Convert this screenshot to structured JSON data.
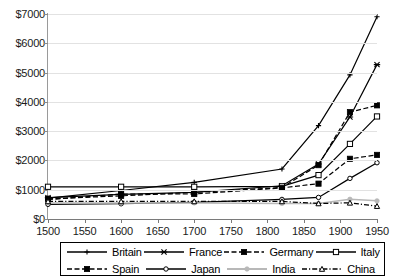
{
  "chart_data": {
    "type": "line",
    "title": "",
    "xlabel": "",
    "ylabel": "",
    "x": [
      1500,
      1600,
      1700,
      1820,
      1870,
      1913,
      1950
    ],
    "xticks": [
      1500,
      1550,
      1600,
      1650,
      1700,
      1750,
      1800,
      1850,
      1900,
      1950
    ],
    "xticklabels": [
      "1500",
      "1550",
      "1600",
      "1650",
      "1700",
      "1750",
      "1800",
      "1850",
      "1900",
      "1950"
    ],
    "yticks": [
      0,
      1000,
      2000,
      3000,
      4000,
      5000,
      6000,
      7000
    ],
    "yticklabels": [
      "$0",
      "$1000",
      "$2000",
      "$3000",
      "$4000",
      "$5000",
      "$6000",
      "$7000"
    ],
    "xlim": [
      1500,
      1950
    ],
    "ylim": [
      0,
      7000
    ],
    "grid": true,
    "legend_position": "bottom",
    "series": [
      {
        "name": "Britain",
        "color": "#000000",
        "dash": "none",
        "marker": "plus",
        "values": [
          714,
          974,
          1250,
          1707,
          3190,
          4921,
          6907
        ]
      },
      {
        "name": "France",
        "color": "#000000",
        "dash": "none",
        "marker": "star",
        "values": [
          727,
          841,
          910,
          1135,
          1876,
          3485,
          5271
        ]
      },
      {
        "name": "Germany",
        "color": "#000000",
        "dash": "dashed",
        "marker": "square-filled",
        "values": [
          688,
          791,
          910,
          1077,
          1839,
          3648,
          3881
        ]
      },
      {
        "name": "Italy",
        "color": "#000000",
        "dash": "none",
        "marker": "square-open",
        "values": [
          1100,
          1100,
          1100,
          1117,
          1499,
          2564,
          3502
        ]
      },
      {
        "name": "Spain",
        "color": "#000000",
        "dash": "dashed",
        "marker": "square-filled",
        "values": [
          661,
          853,
          853,
          1063,
          1207,
          2056,
          2189
        ]
      },
      {
        "name": "Japan",
        "color": "#000000",
        "dash": "none",
        "marker": "circle-open",
        "values": [
          500,
          520,
          570,
          669,
          737,
          1387,
          1921
        ]
      },
      {
        "name": "India",
        "color": "#b8b8b8",
        "dash": "none",
        "marker": "circle-filled",
        "values": [
          550,
          550,
          550,
          533,
          533,
          673,
          619
        ]
      },
      {
        "name": "China",
        "color": "#000000",
        "dash": "dashdot",
        "marker": "triangle-open",
        "values": [
          600,
          600,
          600,
          600,
          530,
          552,
          439
        ]
      }
    ]
  },
  "legend": {
    "rows": [
      [
        {
          "label": "Britain",
          "series": 0
        },
        {
          "label": "France",
          "series": 1
        },
        {
          "label": "Germany",
          "series": 2
        },
        {
          "label": "Italy",
          "series": 3
        }
      ],
      [
        {
          "label": "Spain",
          "series": 4
        },
        {
          "label": "Japan",
          "series": 5
        },
        {
          "label": "India",
          "series": 6
        },
        {
          "label": "China",
          "series": 7
        }
      ]
    ]
  }
}
